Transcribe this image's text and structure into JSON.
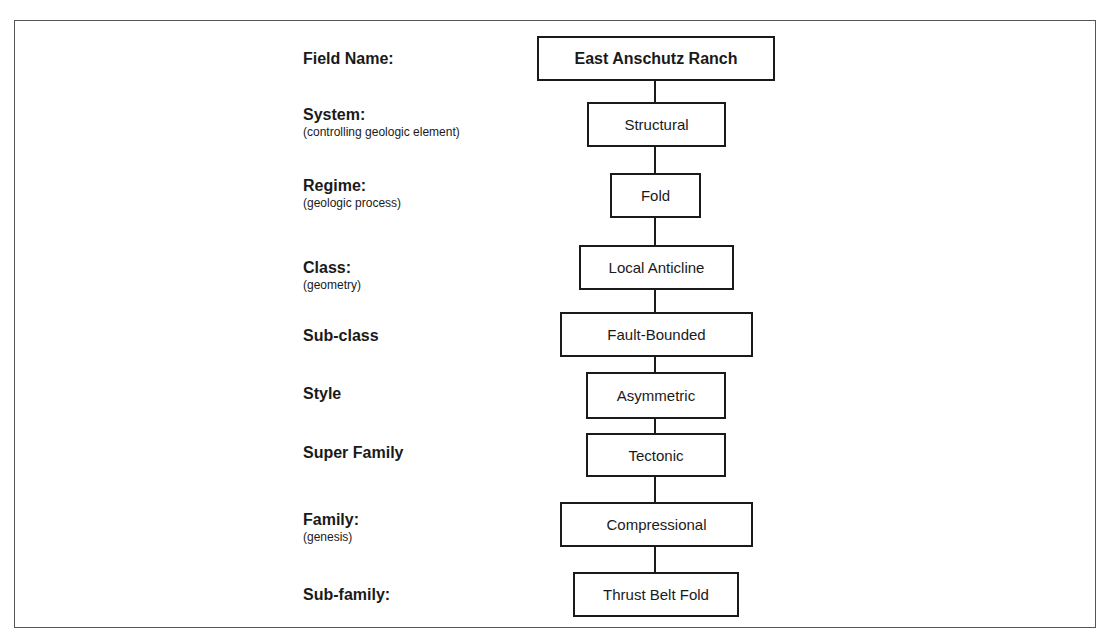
{
  "diagram": {
    "rows": [
      {
        "label": "Field Name:",
        "sublabel": "",
        "value": "East Anschutz Ranch"
      },
      {
        "label": "System:",
        "sublabel": "(controlling geologic element)",
        "value": "Structural"
      },
      {
        "label": "Regime:",
        "sublabel": "(geologic process)",
        "value": "Fold"
      },
      {
        "label": "Class:",
        "sublabel": "(geometry)",
        "value": "Local Anticline"
      },
      {
        "label": "Sub-class",
        "sublabel": "",
        "value": "Fault-Bounded"
      },
      {
        "label": "Style",
        "sublabel": "",
        "value": "Asymmetric"
      },
      {
        "label": "Super Family",
        "sublabel": "",
        "value": "Tectonic"
      },
      {
        "label": "Family:",
        "sublabel": "(genesis)",
        "value": "Compressional"
      },
      {
        "label": "Sub-family:",
        "sublabel": "",
        "value": "Thrust Belt Fold"
      }
    ]
  }
}
